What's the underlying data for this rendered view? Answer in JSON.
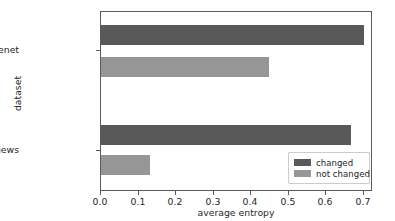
{
  "chart_data": {
    "type": "bar",
    "orientation": "horizontal",
    "title": "",
    "xlabel": "average entropy",
    "ylabel": "dataset",
    "categories": [
      "Tiny Imagenet",
      "Amazon Reviews"
    ],
    "series": [
      {
        "name": "changed",
        "color": "#595959",
        "values": [
          0.7,
          0.665
        ]
      },
      {
        "name": "not changed",
        "color": "#969696",
        "values": [
          0.447,
          0.13
        ]
      }
    ],
    "xlim": [
      0.0,
      0.724
    ],
    "xticks": [
      0.0,
      0.1,
      0.2,
      0.3,
      0.4,
      0.5,
      0.6,
      0.7
    ],
    "xticklabels": [
      "0.0",
      "0.1",
      "0.2",
      "0.3",
      "0.4",
      "0.5",
      "0.6",
      "0.7"
    ],
    "grid": false,
    "legend_position": "lower right",
    "legend_entries": [
      "changed",
      "not changed"
    ]
  }
}
